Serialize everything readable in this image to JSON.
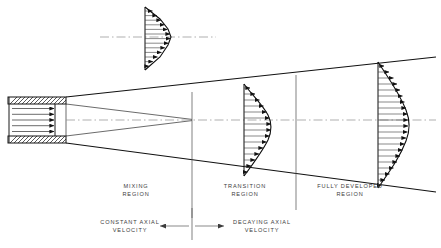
{
  "figure": {
    "background_color": "#ffffff",
    "line_color": "#111111"
  },
  "regions": [
    {
      "id": "mixing",
      "line1": "MIXING",
      "line2": "REGION",
      "center_x": 136,
      "label_y": 188
    },
    {
      "id": "transition",
      "line1": "TRANSITION",
      "line2": "REGION",
      "center_x": 245,
      "label_y": 188
    },
    {
      "id": "fully",
      "line1": "FULLY DEVELOPED",
      "line2": "REGION",
      "center_x": 350,
      "label_y": 188
    }
  ],
  "annotations": [
    {
      "id": "constant-axial-velocity",
      "line1": "CONSTANT AXIAL",
      "line2": "VELOCITY",
      "center_x": 148,
      "label_y": 226,
      "arrow": "left"
    },
    {
      "id": "decaying-axial-velocity",
      "line1": "DECAYING AXIAL",
      "line2": "VELOCITY",
      "center_x": 290,
      "label_y": 226,
      "arrow": "right"
    }
  ],
  "nozzle": {
    "x": 8,
    "y": 97,
    "width": 58,
    "height": 46,
    "wall_thickness": 7,
    "internal_arrow_count": 5,
    "hatch_spacing": 4
  },
  "jet": {
    "origin_top_y": 97,
    "origin_bottom_y": 143,
    "origin_x": 66,
    "right_x": 436,
    "top_right_y": 57,
    "bottom_right_y": 192,
    "potential_core_apex_x": 192,
    "potential_core_apex_y": 120
  },
  "dividers": [
    {
      "id": "divider-mixing-transition",
      "x": 192,
      "y1": 92,
      "y2": 218
    },
    {
      "id": "divider-transition-fully",
      "x": 296,
      "y1": 75,
      "y2": 210
    }
  ],
  "centerlines": [
    {
      "id": "jet-centerline",
      "x1": 66,
      "x2": 436,
      "y": 120
    },
    {
      "id": "detail-centerline",
      "x1": 100,
      "x2": 216,
      "y": 37
    }
  ],
  "profiles": [
    {
      "id": "detail-profile",
      "name": "exit-velocity-profile-detail",
      "baseline_x": 145,
      "top_y": 7,
      "bottom_y": 70,
      "max_extent": 26,
      "arrow_count": 13,
      "shape": "flat-top-core"
    },
    {
      "id": "transition-profile",
      "name": "transition-velocity-profile",
      "baseline_x": 244,
      "top_y": 84,
      "bottom_y": 176,
      "max_extent": 31,
      "arrow_count": 15,
      "shape": "bell"
    },
    {
      "id": "fully-developed-profile",
      "name": "fully-developed-velocity-profile",
      "baseline_x": 378,
      "top_y": 62,
      "bottom_y": 188,
      "max_extent": 38,
      "arrow_count": 21,
      "shape": "bell"
    }
  ]
}
